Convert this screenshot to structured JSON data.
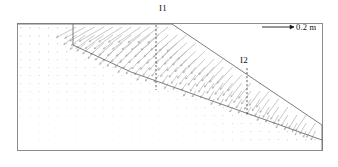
{
  "figure": {
    "type": "displacement-vector-field",
    "frame": {
      "x": 17,
      "y": 23,
      "width": 305,
      "height": 127,
      "stroke": "#8c8c8c"
    },
    "background": "#ffffff",
    "vector_color": "#9a9a9a",
    "line_color": "#6e6e6e",
    "dash_color": "#4a4a4a"
  },
  "labels": {
    "inclinometer_1": "I1",
    "inclinometer_2": "I2",
    "scale_value": "0.2 m"
  },
  "legend": {
    "arrow_length_px": 32,
    "represents": "0.2 m",
    "x": 262,
    "y": 27
  },
  "inclinometers": [
    {
      "name": "I1",
      "x": 156,
      "y_top": 25,
      "y_bottom": 90,
      "label_x": 159,
      "label_y": 3
    },
    {
      "name": "I2",
      "x": 247,
      "y_top": 68,
      "y_bottom": 116,
      "label_x": 240,
      "label_y": 55
    }
  ],
  "geometry": {
    "ground_surface": [
      [
        17,
        24
      ],
      [
        172,
        24
      ],
      [
        322,
        125
      ]
    ],
    "slope_crest": [
      172,
      24
    ],
    "slope_toe": [
      322,
      125
    ],
    "right_face": [
      [
        322,
        125
      ],
      [
        322,
        150
      ]
    ],
    "tension_crack": [
      [
        73,
        24
      ],
      [
        73,
        45
      ]
    ],
    "slip_surface_upper": [
      [
        73,
        45
      ],
      [
        131,
        72
      ]
    ],
    "slip_surface_lower": [
      [
        131,
        72
      ],
      [
        322,
        140
      ]
    ]
  },
  "chart_data": {
    "type": "scatter",
    "title": "",
    "xlabel": "",
    "ylabel": "",
    "grid": false,
    "legend_position": "top-right",
    "annotations": [
      "I1",
      "I2",
      "0.2 m"
    ],
    "vector_grid": {
      "spacing_x": 9.2,
      "spacing_y": 8.0,
      "scale_px_per_metre": 160
    },
    "series": [
      {
        "name": "sliding-mass-vectors",
        "magnitude_range_m": [
          0.02,
          0.22
        ],
        "direction_deg_range": [
          200,
          265
        ]
      },
      {
        "name": "stable-mass-vectors",
        "magnitude_range_m": [
          0.0,
          0.012
        ],
        "direction_deg_range": [
          230,
          280
        ]
      }
    ]
  }
}
